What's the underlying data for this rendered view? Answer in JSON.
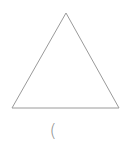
{
  "diagram": {
    "shape": "triangle",
    "stroke_color": "#9a9a9a",
    "vertices": {
      "apex": [
        66,
        13
      ],
      "bottom_left": [
        12,
        108
      ],
      "bottom_right": [
        119,
        108
      ]
    }
  },
  "caption": {
    "text": "("
  }
}
